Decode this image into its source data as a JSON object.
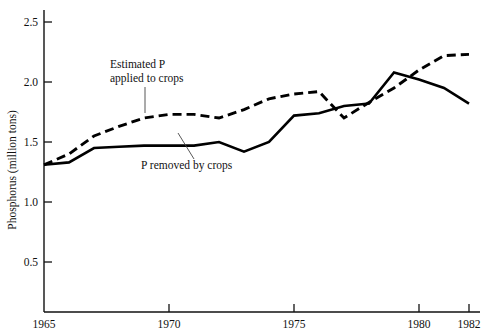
{
  "chart_data": {
    "type": "line",
    "title": "",
    "xlabel": "",
    "ylabel": "Phosphorus (million tons)",
    "xlim": [
      1965,
      1982
    ],
    "ylim": [
      0.083,
      2.65
    ],
    "grid": false,
    "legend_position": "inline-annotations",
    "x": [
      1965,
      1966,
      1967,
      1968,
      1969,
      1970,
      1971,
      1972,
      1973,
      1974,
      1975,
      1976,
      1977,
      1978,
      1979,
      1980,
      1981,
      1982
    ],
    "xticks": [
      1965,
      1970,
      1975,
      1980,
      1982
    ],
    "xticklabels": [
      "1965",
      "1970",
      "1975",
      "1980",
      "1982"
    ],
    "yticks": [
      0.5,
      1.0,
      1.5,
      2.0,
      2.5
    ],
    "yticklabels": [
      "0.5",
      "1.0",
      "1.5",
      "2.0",
      "2.5"
    ],
    "series": [
      {
        "name": "Estimated P applied to crops",
        "style": "dashed",
        "color": "#000000",
        "values": [
          1.31,
          1.4,
          1.55,
          1.63,
          1.7,
          1.73,
          1.73,
          1.7,
          1.77,
          1.86,
          1.9,
          1.92,
          1.7,
          1.83,
          1.95,
          2.1,
          2.22,
          2.23
        ]
      },
      {
        "name": "P removed by crops",
        "style": "solid",
        "color": "#000000",
        "values": [
          1.31,
          1.33,
          1.45,
          1.46,
          1.47,
          1.47,
          1.47,
          1.5,
          1.42,
          1.5,
          1.72,
          1.74,
          1.8,
          1.82,
          2.08,
          2.02,
          1.95,
          1.82
        ]
      }
    ],
    "annotations": [
      {
        "id": "estimated-p-applied",
        "line1": "Estimated P",
        "line2": "applied to crops",
        "text_x": 110,
        "text_y": 68,
        "leader_from": [
          145,
          86
        ],
        "leader_to": [
          145,
          113
        ]
      },
      {
        "id": "p-removed",
        "line1": "P removed by crops",
        "line2": "",
        "text_x": 141,
        "text_y": 169,
        "leader_from": [
          194,
          159
        ],
        "leader_to": [
          178,
          133
        ]
      }
    ]
  },
  "axes": {
    "y_title": "Phosphorus (million tons)"
  }
}
